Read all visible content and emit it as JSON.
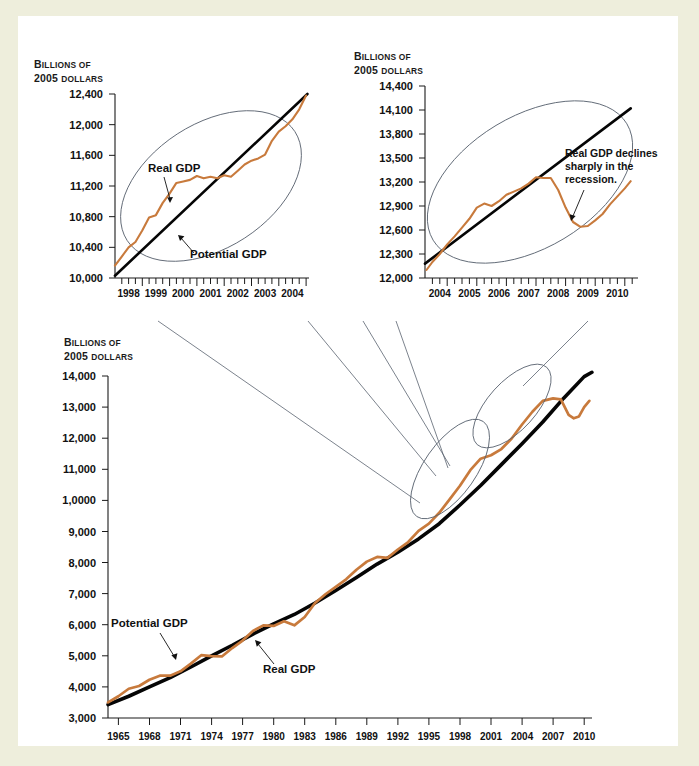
{
  "figure": {
    "background_color": "#eeeedc",
    "plate_color": "#ffffff",
    "real_gdp_color": "#c87a3c",
    "potential_gdp_color": "#050505",
    "callout_color": "#5a6370"
  },
  "axis_titles": {
    "line1": "BILLIONS OF",
    "line2": "2005 DOLLARS",
    "line1_lead": "B",
    "line1_rest": "ILLIONS",
    "line1_of": " OF",
    "line2_year": "2005 ",
    "line2_rest": "DOLLARS"
  },
  "labels": {
    "real_gdp": "Real GDP",
    "potential_gdp": "Potential GDP",
    "recession_note_line1": "Real GDP declines",
    "recession_note_line2": "sharply in the",
    "recession_note_line3": "recession."
  },
  "chart_data": [
    {
      "id": "main-chart",
      "type": "line",
      "title": "",
      "xlabel": "",
      "ylabel": "Billions of 2005 dollars",
      "xlim": [
        1964.0,
        2010.75
      ],
      "ylim": [
        3000,
        14000
      ],
      "grid": false,
      "legend": "inline-annotations",
      "ytick_labels": [
        "14,000",
        "13,000",
        "12,000",
        "11,000",
        "1,0000",
        "9,000",
        "8,000",
        "7,000",
        "6,000",
        "5,000",
        "4,000",
        "3,000"
      ],
      "yticks": [
        14000,
        13000,
        12000,
        11000,
        10000,
        9000,
        8000,
        7000,
        6000,
        5000,
        4000,
        3000
      ],
      "xtick_labels": [
        "1965",
        "1968",
        "1971",
        "1974",
        "1977",
        "1980",
        "1983",
        "1986",
        "1989",
        "1992",
        "1995",
        "1998",
        "2001",
        "2004",
        "2007",
        "2010"
      ],
      "xticks": [
        1965,
        1968,
        1971,
        1974,
        1977,
        1980,
        1983,
        1986,
        1989,
        1992,
        1995,
        1998,
        2001,
        2004,
        2007,
        2010
      ],
      "series": [
        {
          "name": "Potential GDP",
          "color": "#050505",
          "x": [
            1964.0,
            1966,
            1968,
            1970,
            1972,
            1974,
            1976,
            1978,
            1980,
            1982,
            1984,
            1986,
            1988,
            1990,
            1992,
            1994,
            1996,
            1998,
            2000,
            2002,
            2004,
            2006,
            2008,
            2010,
            2010.75
          ],
          "values": [
            3430,
            3700,
            4000,
            4300,
            4640,
            5000,
            5340,
            5700,
            6030,
            6330,
            6700,
            7100,
            7520,
            7950,
            8330,
            8760,
            9250,
            9850,
            10480,
            11150,
            11820,
            12520,
            13280,
            13980,
            14120
          ]
        },
        {
          "name": "Real GDP",
          "color": "#c87a3c",
          "x": [
            1964.0,
            1965,
            1966,
            1967,
            1968,
            1969,
            1970,
            1971,
            1972,
            1973,
            1974,
            1975,
            1976,
            1977,
            1978,
            1979,
            1980,
            1981,
            1982,
            1983,
            1984,
            1985,
            1986,
            1987,
            1988,
            1989,
            1990,
            1991,
            1992,
            1993,
            1994,
            1995,
            1996,
            1997,
            1998,
            1999,
            2000,
            2001,
            2002,
            2003,
            2004,
            2005,
            2006,
            2007,
            2007.75,
            2008.5,
            2009,
            2009.5,
            2010,
            2010.5
          ],
          "values": [
            3500,
            3700,
            3940,
            4030,
            4230,
            4360,
            4360,
            4500,
            4750,
            5020,
            4990,
            4980,
            5250,
            5490,
            5800,
            5980,
            5960,
            6110,
            5980,
            6250,
            6700,
            6980,
            7220,
            7460,
            7770,
            8030,
            8180,
            8150,
            8420,
            8660,
            9020,
            9250,
            9600,
            10030,
            10470,
            10970,
            11340,
            11450,
            11650,
            11990,
            12440,
            12850,
            13200,
            13280,
            13250,
            12750,
            12640,
            12700,
            13000,
            13200
          ]
        }
      ],
      "annotations": [
        {
          "text": "Potential GDP",
          "x": 1975.5,
          "y": 6400
        },
        {
          "text": "Real GDP",
          "x": 1983.5,
          "y": 5000
        }
      ]
    },
    {
      "id": "inset-left",
      "type": "line",
      "title": "",
      "xlabel": "",
      "ylabel": "Billions of 2005 dollars",
      "xlim": [
        1997.5,
        2004.6
      ],
      "ylim": [
        10000,
        12400
      ],
      "grid": false,
      "ytick_labels": [
        "12,400",
        "12,000",
        "11,600",
        "11,200",
        "10,800",
        "10,400",
        "10,000"
      ],
      "yticks": [
        12400,
        12000,
        11600,
        11200,
        10800,
        10400,
        10000
      ],
      "xtick_labels": [
        "1998",
        "1999",
        "2000",
        "2001",
        "2002",
        "2003",
        "2004"
      ],
      "xticks": [
        1998,
        1999,
        2000,
        2001,
        2002,
        2003,
        2004
      ],
      "minor_xtick_interval": 0.25,
      "series": [
        {
          "name": "Potential GDP",
          "color": "#050505",
          "x": [
            1997.5,
            2004.55
          ],
          "values": [
            10030,
            12400
          ]
        },
        {
          "name": "Real GDP",
          "color": "#c87a3c",
          "x": [
            1997.5,
            1997.75,
            1998.0,
            1998.25,
            1998.5,
            1998.75,
            1999.0,
            1999.25,
            1999.5,
            1999.75,
            2000.0,
            2000.25,
            2000.5,
            2000.75,
            2001.0,
            2001.25,
            2001.5,
            2001.75,
            2002.0,
            2002.25,
            2002.5,
            2002.75,
            2003.0,
            2003.25,
            2003.5,
            2003.75,
            2004.0,
            2004.25,
            2004.5
          ],
          "values": [
            10160,
            10280,
            10400,
            10470,
            10620,
            10790,
            10820,
            10980,
            11100,
            11240,
            11260,
            11280,
            11330,
            11300,
            11320,
            11300,
            11340,
            11320,
            11400,
            11480,
            11530,
            11560,
            11610,
            11790,
            11910,
            11980,
            12070,
            12200,
            12380
          ]
        }
      ],
      "annotations": [
        {
          "text": "Real GDP",
          "x": 1999.15,
          "y": 11620
        },
        {
          "text": "Potential GDP",
          "x": 2000.5,
          "y": 10660
        }
      ]
    },
    {
      "id": "inset-right",
      "type": "line",
      "title": "",
      "xlabel": "",
      "ylabel": "Billions of 2005 dollars",
      "xlim": [
        2003.5,
        2010.7
      ],
      "ylim": [
        12000,
        14400
      ],
      "grid": false,
      "ytick_labels": [
        "14,400",
        "14,100",
        "13,800",
        "13,500",
        "13,200",
        "12,900",
        "12,600",
        "12,300",
        "12,000"
      ],
      "yticks": [
        14400,
        14100,
        13800,
        13500,
        13200,
        12900,
        12600,
        12300,
        12000
      ],
      "xtick_labels": [
        "2004",
        "2005",
        "2006",
        "2007",
        "2008",
        "2009",
        "2010"
      ],
      "xticks": [
        2004,
        2005,
        2006,
        2007,
        2008,
        2009,
        2010
      ],
      "minor_xtick_interval": 0.25,
      "series": [
        {
          "name": "Potential GDP",
          "color": "#050505",
          "x": [
            2003.5,
            2010.45
          ],
          "values": [
            12180,
            14120
          ]
        },
        {
          "name": "Real GDP",
          "color": "#c87a3c",
          "x": [
            2003.55,
            2003.75,
            2004.0,
            2004.25,
            2004.5,
            2004.75,
            2005.0,
            2005.25,
            2005.5,
            2005.75,
            2006.0,
            2006.25,
            2006.5,
            2006.75,
            2007.0,
            2007.25,
            2007.5,
            2007.75,
            2008.0,
            2008.25,
            2008.5,
            2008.75,
            2009.0,
            2009.25,
            2009.5,
            2009.75,
            2010.0,
            2010.25,
            2010.45
          ],
          "values": [
            12100,
            12200,
            12300,
            12420,
            12520,
            12630,
            12740,
            12880,
            12930,
            12900,
            12960,
            13040,
            13080,
            13120,
            13180,
            13260,
            13250,
            13250,
            13100,
            12880,
            12700,
            12640,
            12650,
            12720,
            12800,
            12920,
            13020,
            13120,
            13210
          ]
        }
      ],
      "annotations": [
        {
          "text": "Real GDP declines sharply in the recession.",
          "x": 2008.0,
          "y": 13500
        }
      ]
    }
  ]
}
